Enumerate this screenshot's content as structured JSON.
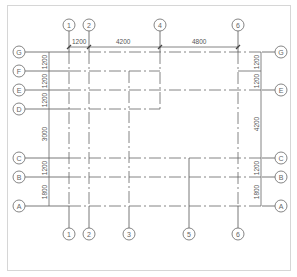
{
  "drawing": {
    "type": "structural-grid-plan",
    "horizontal_axes": [
      {
        "label": "G",
        "y": 52
      },
      {
        "label": "F",
        "y": 71
      },
      {
        "label": "E",
        "y": 90
      },
      {
        "label": "D",
        "y": 109
      },
      {
        "label": "C",
        "y": 158
      },
      {
        "label": "B",
        "y": 177
      },
      {
        "label": "A",
        "y": 206
      }
    ],
    "vertical_axes": [
      {
        "label": "1",
        "x": 69
      },
      {
        "label": "2",
        "x": 89
      },
      {
        "label": "3",
        "x": 129
      },
      {
        "label": "4",
        "x": 160
      },
      {
        "label": "5",
        "x": 189
      },
      {
        "label": "6",
        "x": 238
      }
    ],
    "top_bubbles": [
      "1",
      "2",
      "4",
      "6"
    ],
    "bottom_bubbles": [
      "1",
      "2",
      "3",
      "5",
      "6"
    ],
    "left_bubbles": [
      "G",
      "F",
      "E",
      "D",
      "C",
      "B",
      "A"
    ],
    "right_bubbles": [
      "G",
      "E",
      "C",
      "B",
      "A"
    ],
    "top_dimensions": [
      "1200",
      "4200",
      "4800"
    ],
    "left_dimensions": [
      "1200",
      "1200",
      "1200",
      "3000",
      "1200",
      "1800"
    ],
    "right_dimensions": [
      "1200",
      "1200",
      "4200",
      "1200",
      "1800"
    ]
  }
}
